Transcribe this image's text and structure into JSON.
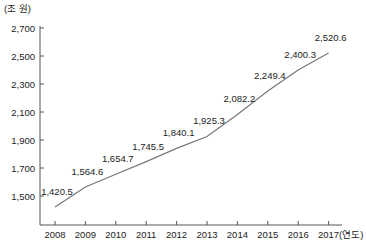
{
  "chart_data": {
    "type": "line",
    "title": "",
    "xlabel": "(연도)",
    "ylabel": "(조 원)",
    "categories": [
      "2008",
      "2009",
      "2010",
      "2011",
      "2012",
      "2013",
      "2014",
      "2015",
      "2016",
      "2017"
    ],
    "series": [
      {
        "name": "",
        "values": [
          1420.5,
          1564.6,
          1654.7,
          1745.5,
          1840.1,
          1925.3,
          2082.2,
          2249.4,
          2400.3,
          2520.6
        ]
      }
    ],
    "data_labels": [
      "1,420.5",
      "1,564.6",
      "1,654.7",
      "1,745.5",
      "1,840.1",
      "1,925.3",
      "2,082.2",
      "2,249.4",
      "2,400.3",
      "2,520.6"
    ],
    "yticks": [
      "2,700",
      "2,500",
      "2,300",
      "2,100",
      "1,900",
      "1,700",
      "1,500"
    ],
    "ytick_values": [
      2700,
      2500,
      2300,
      2100,
      1900,
      1700,
      1500
    ],
    "ylim": [
      1300,
      2700
    ],
    "grid": false,
    "legend": "none",
    "line_color": "#777777"
  }
}
